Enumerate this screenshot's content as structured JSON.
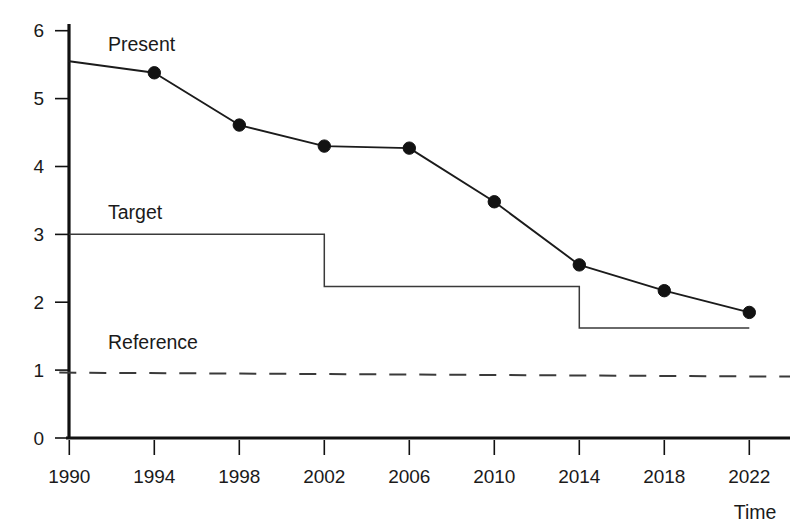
{
  "chart_data": {
    "type": "line",
    "title": "",
    "xlabel": "Time",
    "ylabel": "",
    "grid": false,
    "legend_position": "inline-annotations",
    "x": [
      1990,
      1994,
      1998,
      2002,
      2006,
      2010,
      2014,
      2018,
      2022
    ],
    "categories": [
      "1990",
      "1994",
      "1998",
      "2002",
      "2006",
      "2010",
      "2014",
      "2018",
      "2022"
    ],
    "xlim": [
      1990,
      2022
    ],
    "ylim": [
      0,
      6
    ],
    "ytick_labels": [
      "0",
      "1",
      "2",
      "3",
      "4",
      "5",
      "6"
    ],
    "ytick_values": [
      0,
      1,
      2,
      3,
      4,
      5,
      6
    ],
    "xtick_labels": [
      "1990",
      "1994",
      "1998",
      "2002",
      "2006",
      "2010",
      "2014",
      "2018",
      "2022"
    ],
    "series": [
      {
        "name": "Present",
        "style": "solid-with-markers",
        "markers": true,
        "label": "Present",
        "values": [
          5.55,
          5.38,
          4.61,
          4.3,
          4.27,
          3.48,
          2.55,
          2.17,
          1.85
        ]
      },
      {
        "name": "Target",
        "style": "step",
        "markers": false,
        "label": "Target",
        "step_points": [
          {
            "x": 1990,
            "y": 3.0
          },
          {
            "x": 2002,
            "y": 3.0
          },
          {
            "x": 2002,
            "y": 2.23
          },
          {
            "x": 2014,
            "y": 2.23
          },
          {
            "x": 2014,
            "y": 1.62
          },
          {
            "x": 2022,
            "y": 1.62
          }
        ],
        "values": [
          3.0,
          3.0,
          3.0,
          2.23,
          2.23,
          2.23,
          1.62,
          1.62,
          1.62
        ]
      },
      {
        "name": "Reference",
        "style": "dashed",
        "markers": false,
        "label": "Reference",
        "constant": 1.0,
        "values": [
          1.0,
          1.0,
          1.0,
          1.0,
          1.0,
          1.0,
          1.0,
          1.0,
          1.0
        ]
      }
    ],
    "annotations": [
      {
        "text": "Present",
        "x": 1994.8,
        "y": 5.95
      },
      {
        "text": "Target",
        "x": 1994.8,
        "y": 3.35
      },
      {
        "text": "Reference",
        "x": 1994.8,
        "y": 1.42
      }
    ],
    "colors": {
      "present_line": "#1b1b1b",
      "target_line": "#3a3a3a",
      "reference_line": "#3a3a3a",
      "axis": "#111111",
      "text": "#1a1a1a",
      "background": "#ffffff"
    }
  }
}
